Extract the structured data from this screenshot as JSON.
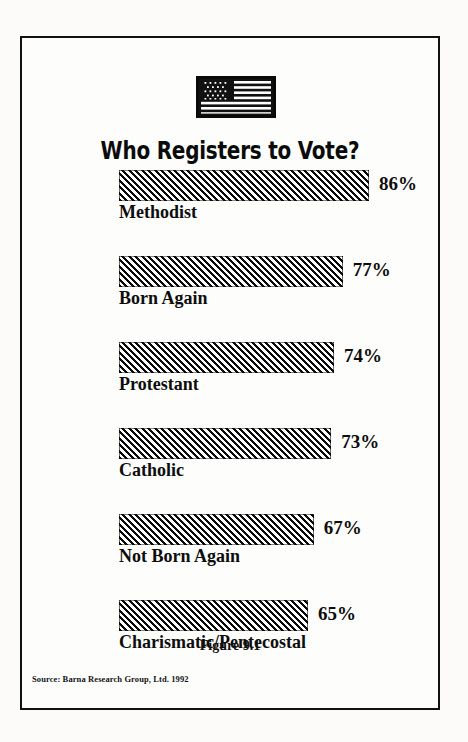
{
  "figure": {
    "title": "Who Registers to Vote?",
    "caption": "Figure 9.1",
    "source": "Source: Barna Research Group, Ltd. 1992",
    "flag_icon": "us-flag-icon"
  },
  "chart_data": {
    "type": "bar",
    "orientation": "horizontal",
    "title": "Who Registers to Vote?",
    "xlabel": "",
    "ylabel": "",
    "xlim": [
      0,
      100
    ],
    "grid": false,
    "legend": null,
    "value_suffix": "%",
    "categories": [
      "Methodist",
      "Born Again",
      "Protestant",
      "Catholic",
      "Not Born Again",
      "Charismatic/Pentecostal"
    ],
    "values": [
      86,
      77,
      74,
      73,
      67,
      65
    ],
    "value_labels": [
      "86%",
      "77%",
      "74%",
      "73%",
      "67%",
      "65%"
    ],
    "bars": [
      {
        "category": "Methodist",
        "value": 86,
        "label": "86%"
      },
      {
        "category": "Born Again",
        "value": 77,
        "label": "77%"
      },
      {
        "category": "Protestant",
        "value": 74,
        "label": "74%"
      },
      {
        "category": "Catholic",
        "value": 73,
        "label": "73%"
      },
      {
        "category": "Not Born Again",
        "value": 67,
        "label": "67%"
      },
      {
        "category": "Charismatic/Pentecostal",
        "value": 65,
        "label": "65%"
      }
    ],
    "colors": {
      "bar_hatch": "#0a0a0a",
      "bar_fill": "#ffffff",
      "text": "#0d0d0d",
      "border": "#111111",
      "background": "#fdfdfc"
    }
  }
}
